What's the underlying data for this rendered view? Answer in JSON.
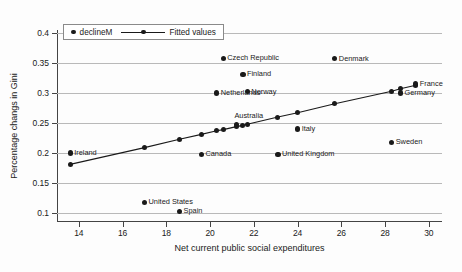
{
  "chart_data": {
    "type": "scatter",
    "title": "",
    "xlabel": "Net current public social expenditures",
    "ylabel": "Percentage changs in Gini",
    "xlim": [
      13.0,
      30.6
    ],
    "ylim": [
      0.085,
      0.405
    ],
    "xticks": [
      14,
      16,
      18,
      20,
      22,
      24,
      26,
      28,
      30
    ],
    "xtick_labels": [
      "14",
      "16",
      "18",
      "20",
      "22",
      "24",
      "26",
      "28",
      "30"
    ],
    "yticks": [
      0.1,
      0.15,
      0.2,
      0.25,
      0.3,
      0.35,
      0.4
    ],
    "ytick_labels": [
      "0.1",
      "0.15",
      "0.2",
      "0.25",
      "0.3",
      "0.35",
      "0.4"
    ],
    "grid": "horizontal",
    "grid_color": "#b9b9b9",
    "legend_position": "top-left",
    "legend": [
      {
        "label": "declineM",
        "marker": "circle"
      },
      {
        "label": "Fitted values",
        "marker": "line-circle"
      }
    ],
    "series": [
      {
        "name": "declineM",
        "marker": "circle",
        "color": "#1a1a1a",
        "points": [
          {
            "label": "Ireland",
            "x": 13.6,
            "y": 0.2,
            "label_side": "right"
          },
          {
            "label": "United States",
            "x": 17.0,
            "y": 0.118,
            "label_side": "right"
          },
          {
            "label": "Spain",
            "x": 18.6,
            "y": 0.103,
            "label_side": "right"
          },
          {
            "label": "Canada",
            "x": 19.6,
            "y": 0.198,
            "label_side": "right"
          },
          {
            "label": "Australia",
            "x": 21.2,
            "y": 0.247,
            "label_side": "above"
          },
          {
            "label": "Netherlands",
            "x": 20.3,
            "y": 0.3,
            "label_side": "right"
          },
          {
            "label": "Czech Republic",
            "x": 20.6,
            "y": 0.358,
            "label_side": "right"
          },
          {
            "label": "Finland",
            "x": 21.5,
            "y": 0.331,
            "label_side": "right"
          },
          {
            "label": "Norway",
            "x": 21.7,
            "y": 0.302,
            "label_side": "right"
          },
          {
            "label": "United Kingdom",
            "x": 23.1,
            "y": 0.198,
            "label_side": "right"
          },
          {
            "label": "Italy",
            "x": 24.0,
            "y": 0.24,
            "label_side": "right"
          },
          {
            "label": "Denmark",
            "x": 25.7,
            "y": 0.357,
            "label_side": "right"
          },
          {
            "label": "Sweden",
            "x": 28.3,
            "y": 0.218,
            "label_side": "right"
          },
          {
            "label": "Germany",
            "x": 28.7,
            "y": 0.3,
            "label_side": "right"
          },
          {
            "label": "France",
            "x": 29.4,
            "y": 0.315,
            "label_side": "right"
          }
        ]
      },
      {
        "name": "Fitted values",
        "marker": "line-circle",
        "color": "#1a1a1a",
        "points": [
          {
            "x": 13.6,
            "y": 0.181
          },
          {
            "x": 17.0,
            "y": 0.209
          },
          {
            "x": 18.6,
            "y": 0.223
          },
          {
            "x": 19.6,
            "y": 0.231
          },
          {
            "x": 20.3,
            "y": 0.237
          },
          {
            "x": 20.6,
            "y": 0.239
          },
          {
            "x": 21.2,
            "y": 0.244
          },
          {
            "x": 21.5,
            "y": 0.246
          },
          {
            "x": 21.7,
            "y": 0.248
          },
          {
            "x": 23.1,
            "y": 0.26
          },
          {
            "x": 24.0,
            "y": 0.267
          },
          {
            "x": 25.7,
            "y": 0.282
          },
          {
            "x": 28.3,
            "y": 0.303
          },
          {
            "x": 28.7,
            "y": 0.307
          },
          {
            "x": 29.4,
            "y": 0.313
          }
        ]
      }
    ]
  }
}
